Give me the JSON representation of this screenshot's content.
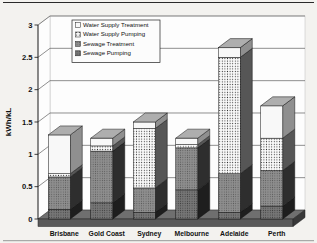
{
  "figure": {
    "kind": "3d-stacked-column-chart",
    "background_color": "#f3f2ef",
    "border_color": "#2a2a2a"
  },
  "chart_data": {
    "type": "bar",
    "stacked": true,
    "style_3d": true,
    "title": "",
    "xlabel": "",
    "ylabel": "kWh/kL",
    "ylim": [
      0,
      3
    ],
    "ytick_step": 0.5,
    "yticks": [
      "0",
      "0.5",
      "1",
      "1.5",
      "2",
      "2.5",
      "3"
    ],
    "grid": true,
    "legend_position": "top-center-inside",
    "categories": [
      "Brisbane",
      "Gold Coast",
      "Sydney",
      "Melbourne",
      "Adelaide",
      "Perth"
    ],
    "series": [
      {
        "name": "Sewage Pumping",
        "values": [
          0.15,
          0.25,
          0.1,
          0.45,
          0.1,
          0.2
        ],
        "front": "#767676",
        "side": "#1e1e1e",
        "pattern": "speckle-dark"
      },
      {
        "name": "Sewage Treatment",
        "values": [
          0.5,
          0.8,
          0.38,
          0.65,
          0.6,
          0.55
        ],
        "front": "#8e8e8e",
        "side": "#2e2e2e",
        "pattern": "speckle"
      },
      {
        "name": "Water Supply Pumping",
        "values": [
          0.05,
          0.08,
          0.92,
          0.05,
          1.8,
          0.5
        ],
        "front": "#fafafa",
        "side": "#565656",
        "pattern": "dots"
      },
      {
        "name": "Water Supply Treatment",
        "values": [
          0.6,
          0.12,
          0.1,
          0.1,
          0.15,
          0.5
        ],
        "front": "#f8f8f8",
        "side": "#8f8f8f",
        "pattern": "none"
      }
    ],
    "totals": [
      1.3,
      1.25,
      1.5,
      1.25,
      2.65,
      1.75
    ],
    "legend_order": [
      "Water Supply Treatment",
      "Water Supply Pumping",
      "Sewage Treatment",
      "Sewage Pumping"
    ],
    "colors": {
      "gridline": "#444444",
      "axis": "#111111",
      "floor_top": "#6f6f6f",
      "floor_front": "#5a5a5a",
      "floor_side": "#383838",
      "wall": "#fdfdfd",
      "bar_top_face": "#aeaeae",
      "text": "#111111"
    }
  }
}
